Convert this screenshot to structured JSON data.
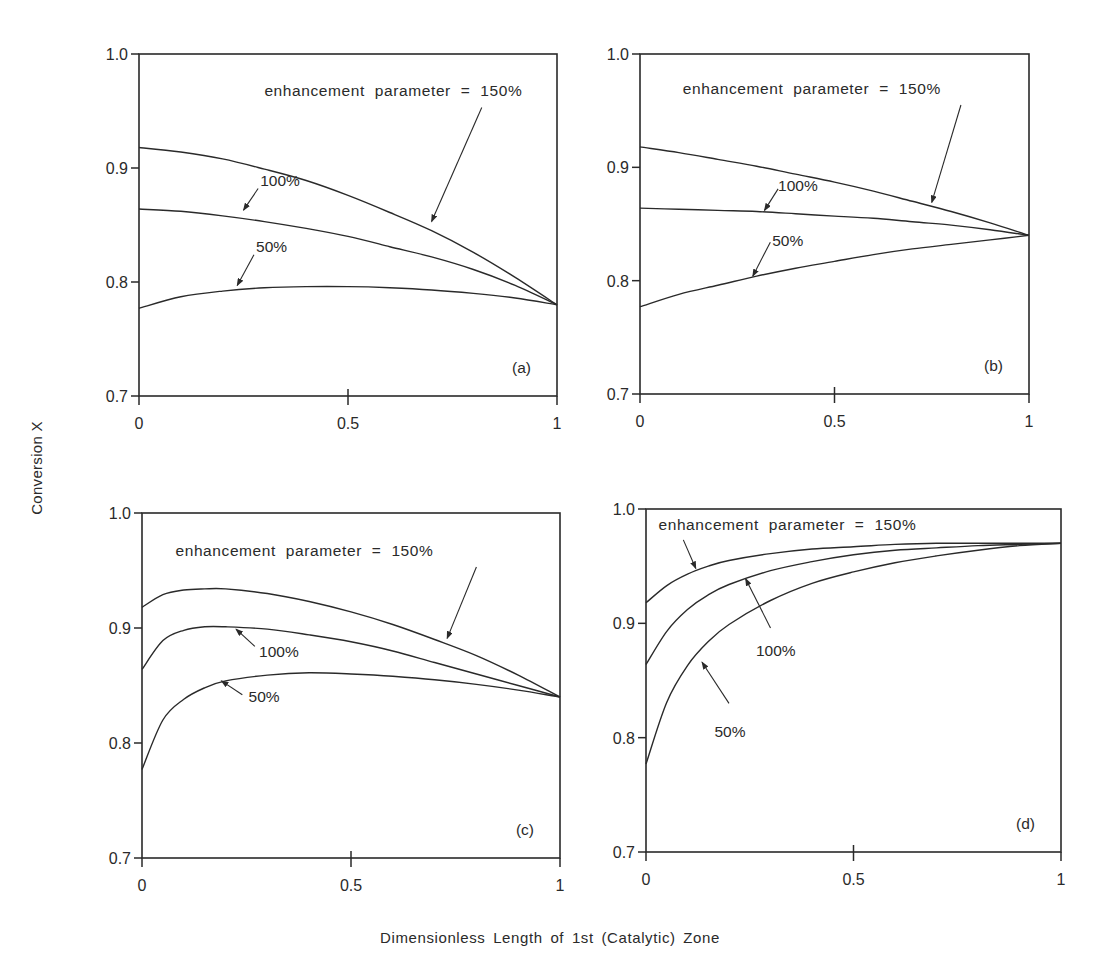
{
  "figure": {
    "ylabel": "Conversion X",
    "xlabel": "Dimensionless Length of 1st (Catalytic) Zone"
  },
  "chart_data": [
    {
      "type": "line",
      "panel": "(a)",
      "xlabel": "Dimensionless Length of 1st (Catalytic) Zone",
      "ylabel": "Conversion X",
      "xlim": [
        0,
        1
      ],
      "ylim": [
        0.7,
        1.0
      ],
      "xticks": [
        "0",
        "0.5",
        "1"
      ],
      "yticks": [
        "0.7",
        "0.8",
        "0.9",
        "1.0"
      ],
      "grid": false,
      "annotation": "enhancement parameter = 150%",
      "x": [
        0,
        0.1,
        0.2,
        0.3,
        0.4,
        0.5,
        0.6,
        0.7,
        0.8,
        0.9,
        1.0
      ],
      "series": [
        {
          "name": "150%",
          "values": [
            0.918,
            0.914,
            0.908,
            0.899,
            0.889,
            0.876,
            0.861,
            0.845,
            0.826,
            0.804,
            0.78
          ]
        },
        {
          "name": "100%",
          "values": [
            0.864,
            0.862,
            0.858,
            0.853,
            0.847,
            0.84,
            0.831,
            0.822,
            0.811,
            0.797,
            0.78
          ]
        },
        {
          "name": "50%",
          "values": [
            0.777,
            0.787,
            0.792,
            0.795,
            0.796,
            0.796,
            0.795,
            0.793,
            0.79,
            0.786,
            0.78
          ]
        }
      ]
    },
    {
      "type": "line",
      "panel": "(b)",
      "xlabel": "Dimensionless Length of 1st (Catalytic) Zone",
      "ylabel": "Conversion X",
      "xlim": [
        0,
        1
      ],
      "ylim": [
        0.7,
        1.0
      ],
      "xticks": [
        "0",
        "0.5",
        "1"
      ],
      "yticks": [
        "0.7",
        "0.8",
        "0.9",
        "1.0"
      ],
      "grid": false,
      "annotation": "enhancement parameter = 150%",
      "x": [
        0,
        0.1,
        0.2,
        0.3,
        0.4,
        0.5,
        0.6,
        0.7,
        0.8,
        0.9,
        1.0
      ],
      "series": [
        {
          "name": "150%",
          "values": [
            0.918,
            0.913,
            0.907,
            0.901,
            0.894,
            0.887,
            0.879,
            0.87,
            0.861,
            0.851,
            0.84
          ]
        },
        {
          "name": "100%",
          "values": [
            0.864,
            0.863,
            0.862,
            0.861,
            0.859,
            0.857,
            0.855,
            0.852,
            0.849,
            0.845,
            0.84
          ]
        },
        {
          "name": "50%",
          "values": [
            0.777,
            0.788,
            0.796,
            0.804,
            0.811,
            0.817,
            0.823,
            0.828,
            0.832,
            0.836,
            0.84
          ]
        }
      ]
    },
    {
      "type": "line",
      "panel": "(c)",
      "xlabel": "Dimensionless Length of 1st (Catalytic) Zone",
      "ylabel": "Conversion X",
      "xlim": [
        0,
        1
      ],
      "ylim": [
        0.7,
        1.0
      ],
      "xticks": [
        "0",
        "0.5",
        "1"
      ],
      "yticks": [
        "0.7",
        "0.8",
        "0.9",
        "1.0"
      ],
      "grid": false,
      "annotation": "enhancement parameter = 150%",
      "x": [
        0,
        0.05,
        0.1,
        0.15,
        0.2,
        0.3,
        0.4,
        0.5,
        0.6,
        0.7,
        0.8,
        0.9,
        1.0
      ],
      "series": [
        {
          "name": "150%",
          "values": [
            0.918,
            0.929,
            0.933,
            0.934,
            0.934,
            0.93,
            0.923,
            0.914,
            0.903,
            0.89,
            0.876,
            0.859,
            0.84
          ]
        },
        {
          "name": "100%",
          "values": [
            0.864,
            0.889,
            0.898,
            0.901,
            0.901,
            0.899,
            0.894,
            0.888,
            0.88,
            0.87,
            0.86,
            0.85,
            0.84
          ]
        },
        {
          "name": "50%",
          "values": [
            0.777,
            0.82,
            0.838,
            0.848,
            0.854,
            0.859,
            0.861,
            0.86,
            0.858,
            0.855,
            0.851,
            0.846,
            0.84
          ]
        }
      ]
    },
    {
      "type": "line",
      "panel": "(d)",
      "xlabel": "Dimensionless Length of 1st (Catalytic) Zone",
      "ylabel": "Conversion X",
      "xlim": [
        0,
        1
      ],
      "ylim": [
        0.7,
        1.0
      ],
      "xticks": [
        "0",
        "0.5",
        "1"
      ],
      "yticks": [
        "0.7",
        "0.8",
        "0.9",
        "1.0"
      ],
      "grid": false,
      "annotation": "enhancement parameter = 150%",
      "x": [
        0,
        0.05,
        0.1,
        0.15,
        0.2,
        0.3,
        0.4,
        0.5,
        0.6,
        0.7,
        0.8,
        0.9,
        1.0
      ],
      "series": [
        {
          "name": "150%",
          "values": [
            0.918,
            0.933,
            0.943,
            0.95,
            0.955,
            0.961,
            0.965,
            0.967,
            0.969,
            0.97,
            0.97,
            0.97,
            0.97
          ]
        },
        {
          "name": "100%",
          "values": [
            0.864,
            0.893,
            0.912,
            0.925,
            0.934,
            0.946,
            0.954,
            0.96,
            0.964,
            0.966,
            0.968,
            0.969,
            0.97
          ]
        },
        {
          "name": "50%",
          "values": [
            0.777,
            0.831,
            0.863,
            0.884,
            0.899,
            0.92,
            0.935,
            0.945,
            0.953,
            0.959,
            0.964,
            0.968,
            0.97
          ]
        }
      ]
    }
  ],
  "panels": [
    {
      "id": "a",
      "label": "(a)",
      "box": {
        "left": 139,
        "top": 54,
        "right": 557,
        "bottom": 396
      },
      "annotation": {
        "text": "enhancement parameter = 150%",
        "x": 0.3,
        "y": 0.963
      },
      "labels": [
        {
          "text": "100%",
          "x": 0.29,
          "y": 0.884
        },
        {
          "text": "50%",
          "x": 0.28,
          "y": 0.826
        }
      ],
      "arrows": [
        {
          "from": [
            0.82,
            0.953
          ],
          "to": [
            0.7,
            0.853
          ]
        },
        {
          "from": [
            0.285,
            0.882
          ],
          "to": [
            0.25,
            0.863
          ]
        },
        {
          "from": [
            0.275,
            0.824
          ],
          "to": [
            0.235,
            0.797
          ]
        }
      ]
    },
    {
      "id": "b",
      "label": "(b)",
      "box": {
        "left": 640,
        "top": 54,
        "right": 1029,
        "bottom": 394
      },
      "annotation": {
        "text": "enhancement parameter = 150%",
        "x": 0.11,
        "y": 0.965
      },
      "labels": [
        {
          "text": "100%",
          "x": 0.355,
          "y": 0.879
        },
        {
          "text": "50%",
          "x": 0.34,
          "y": 0.831
        }
      ],
      "arrows": [
        {
          "from": [
            0.825,
            0.955
          ],
          "to": [
            0.75,
            0.869
          ]
        },
        {
          "from": [
            0.355,
            0.881
          ],
          "to": [
            0.32,
            0.862
          ]
        },
        {
          "from": [
            0.335,
            0.834
          ],
          "to": [
            0.29,
            0.804
          ]
        }
      ]
    },
    {
      "id": "c",
      "label": "(c)",
      "box": {
        "left": 142,
        "top": 513,
        "right": 560,
        "bottom": 858
      },
      "annotation": {
        "text": "enhancement parameter = 150%",
        "x": 0.08,
        "y": 0.963
      },
      "labels": [
        {
          "text": "100%",
          "x": 0.28,
          "y": 0.875
        },
        {
          "text": "50%",
          "x": 0.255,
          "y": 0.836
        }
      ],
      "arrows": [
        {
          "from": [
            0.8,
            0.953
          ],
          "to": [
            0.73,
            0.891
          ]
        },
        {
          "from": [
            0.27,
            0.884
          ],
          "to": [
            0.225,
            0.899
          ]
        },
        {
          "from": [
            0.24,
            0.842
          ],
          "to": [
            0.19,
            0.854
          ]
        }
      ]
    },
    {
      "id": "d",
      "label": "(d)",
      "box": {
        "left": 646,
        "top": 509,
        "right": 1061,
        "bottom": 852
      },
      "annotation": {
        "text": "enhancement parameter = 150%",
        "x": 0.03,
        "y": 0.982
      },
      "labels": [
        {
          "text": "100%",
          "x": 0.265,
          "y": 0.871
        },
        {
          "text": "50%",
          "x": 0.165,
          "y": 0.801
        }
      ],
      "arrows": [
        {
          "from": [
            0.09,
            0.973
          ],
          "to": [
            0.12,
            0.948
          ]
        },
        {
          "from": [
            0.3,
            0.896
          ],
          "to": [
            0.24,
            0.939
          ]
        },
        {
          "from": [
            0.2,
            0.83
          ],
          "to": [
            0.135,
            0.866
          ]
        }
      ]
    }
  ],
  "colors": {
    "ink": "#2a2a2a",
    "background": "#ffffff"
  }
}
